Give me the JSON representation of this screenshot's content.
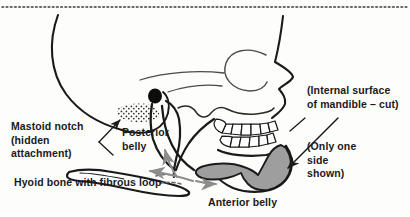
{
  "figure": {
    "background_color": "#fdfdfc",
    "line_color": "#1a1a1a",
    "text_color": "#1a1a1a",
    "muscle_fill_color": "#9e9e9e",
    "arrow_color": "#8c8c8c",
    "top_border": "dotted"
  },
  "labels": {
    "mastoid_notch": "Mastoid notch\n(hidden\nattachment)",
    "posterior_belly": "Posterior\nbelly",
    "hyoid_bone": "Hyoid bone with fibrous loop",
    "anterior_belly": "Anterior belly",
    "internal_surface": "(Internal surface\nof mandible – cut)",
    "only_one_side": "(Only one\nside\nshown)"
  },
  "structures": [
    {
      "name": "cranium",
      "description": "Cranial vault outline, left side"
    },
    {
      "name": "facial-profile",
      "description": "Forehead, nasal bridge and nose profile, right side"
    },
    {
      "name": "orbit",
      "description": "Eye socket outline"
    },
    {
      "name": "mastoid-notch-stipple",
      "description": "Stippled attachment area on mastoid region"
    },
    {
      "name": "styloid-process",
      "description": "Solid black filled oval"
    },
    {
      "name": "maxillary-teeth",
      "description": "Upper tooth row"
    },
    {
      "name": "mandibular-teeth",
      "description": "Lower tooth row"
    },
    {
      "name": "mandible",
      "description": "Internal surface of mandible, cut"
    },
    {
      "name": "posterior-belly-muscle",
      "description": "Posterior belly of digastric, from mastoid notch to hyoid"
    },
    {
      "name": "anterior-belly-muscle",
      "description": "Anterior belly of digastric, shaded grey"
    },
    {
      "name": "hyoid-bone",
      "description": "Hyoid bone with fibrous loop"
    },
    {
      "name": "action-arrows",
      "description": "Grey curved arrows showing direction of muscle pull"
    }
  ]
}
